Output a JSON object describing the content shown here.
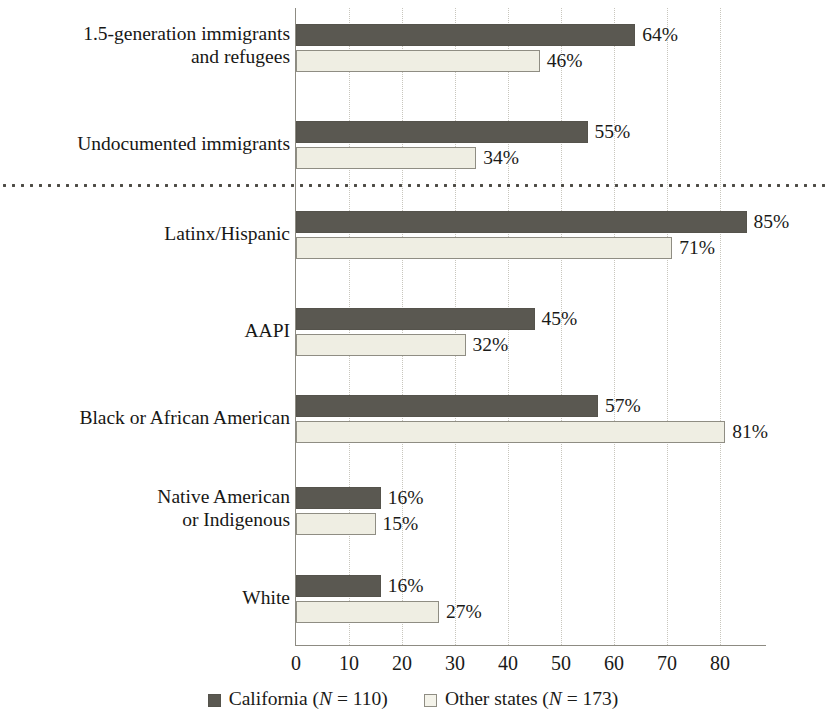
{
  "chart_data": {
    "type": "bar",
    "orientation": "horizontal",
    "title": "",
    "subtitle": "",
    "xlabel": "",
    "ylabel": "",
    "xlim": [
      0,
      88.7
    ],
    "xticks": [
      0,
      10,
      20,
      30,
      40,
      50,
      60,
      70,
      80
    ],
    "xtick_labels": [
      "0",
      "10",
      "20",
      "30",
      "40",
      "50",
      "60",
      "70",
      "80"
    ],
    "grid": true,
    "grid_axis": "x",
    "grid_style": "dotted",
    "value_label_suffix": "%",
    "legend_position": "bottom-center",
    "separator_after_category_index": 1,
    "categories": [
      "1.5-generation immigrants\nand refugees",
      "Undocumented immigrants",
      "Latinx/Hispanic",
      "AAPI",
      "Black or African American",
      "Native American\nor Indigenous",
      "White"
    ],
    "series": [
      {
        "name": "California",
        "n": 110,
        "legend_label": "California (N = 110)",
        "color": "#5a5851",
        "values": [
          64,
          55,
          85,
          45,
          57,
          16,
          16
        ],
        "value_labels": [
          "64%",
          "55%",
          "85%",
          "45%",
          "57%",
          "16%",
          "16%"
        ]
      },
      {
        "name": "Other states",
        "n": 173,
        "legend_label": "Other states (N = 173)",
        "color": "#efeee3",
        "values": [
          46,
          34,
          71,
          32,
          81,
          15,
          27
        ],
        "value_labels": [
          "46%",
          "34%",
          "71%",
          "32%",
          "81%",
          "15%",
          "27%"
        ]
      }
    ]
  },
  "legend": {
    "items": [
      {
        "label_prefix": "California (",
        "italic": "N",
        "label_suffix": " = 110)",
        "swatch": "dark"
      },
      {
        "label_prefix": "Other states (",
        "italic": "N",
        "label_suffix": " = 173)",
        "swatch": "light"
      }
    ]
  }
}
